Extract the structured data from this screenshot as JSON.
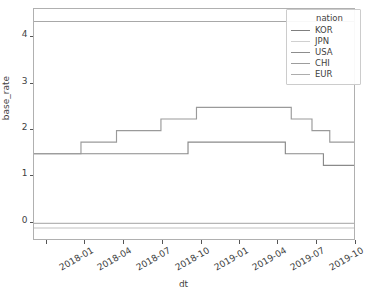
{
  "chart_data": {
    "type": "line",
    "title": "",
    "xlabel": "dt",
    "ylabel": "base_rate",
    "xlim": [
      "2017-12-01",
      "2020-01-01"
    ],
    "ylim": [
      -0.38,
      4.62
    ],
    "yticks": [
      "0",
      "1",
      "2",
      "3",
      "4"
    ],
    "ytick_values": [
      0,
      1,
      2,
      3,
      4
    ],
    "xticks": [
      "2018-01",
      "2018-04",
      "2018-07",
      "2018-10",
      "2019-01",
      "2019-04",
      "2019-07",
      "2019-10",
      "2020-01"
    ],
    "grid": false,
    "drawstyle": "steps-post",
    "legend": {
      "title": "nation",
      "position": "upper right",
      "entries": [
        "KOR",
        "JPN",
        "USA",
        "CHI",
        "EUR"
      ]
    },
    "series": [
      {
        "name": "KOR",
        "color": "#8a8a8a",
        "x": [
          "2017-12-01",
          "2018-11-30",
          "2019-07-18",
          "2019-10-16",
          "2020-01-01"
        ],
        "values": [
          1.5,
          1.75,
          1.5,
          1.25,
          1.25
        ]
      },
      {
        "name": "JPN",
        "color": "#c2c2c2",
        "x": [
          "2017-12-01",
          "2020-01-01"
        ],
        "values": [
          -0.1,
          -0.1
        ]
      },
      {
        "name": "USA",
        "color": "#9a9a9a",
        "x": [
          "2017-12-01",
          "2018-03-22",
          "2018-06-14",
          "2018-09-27",
          "2018-12-20",
          "2019-08-01",
          "2019-09-19",
          "2019-10-31",
          "2020-01-01"
        ],
        "values": [
          1.5,
          1.75,
          2.0,
          2.25,
          2.5,
          2.25,
          2.0,
          1.75,
          1.75
        ]
      },
      {
        "name": "CHI",
        "color": "#a8a8a8",
        "x": [
          "2017-12-01",
          "2019-08-20",
          "2020-01-01"
        ],
        "values": [
          4.35,
          4.35,
          4.35
        ]
      },
      {
        "name": "EUR",
        "color": "#b5b5b5",
        "x": [
          "2017-12-01",
          "2020-01-01"
        ],
        "values": [
          0.0,
          0.0
        ]
      }
    ]
  },
  "legend_swatch_colors": {
    "KOR": "#7f7f7f",
    "JPN": "#d0d0d0",
    "USA": "#8d8d8d",
    "CHI": "#9d9d9d",
    "EUR": "#adadad"
  },
  "axes": {
    "frame_color": "#b0b0b0",
    "tick_color": "#555555",
    "text_color": "#3f3f3f",
    "background": "#ffffff"
  }
}
